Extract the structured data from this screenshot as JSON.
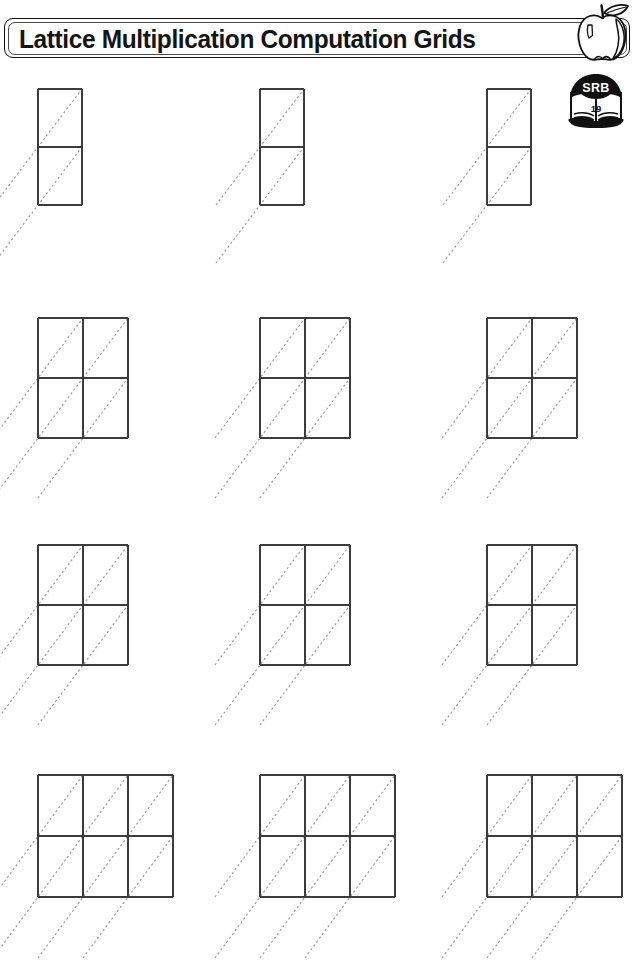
{
  "page": {
    "width": 641,
    "height": 938,
    "background": "#ffffff"
  },
  "header": {
    "title": "Lattice Multiplication Computation Grids",
    "banner_border_color": "#111111",
    "banner_fill": "#ffffff",
    "title_color": "#141414",
    "apple_icon": "apple-icon",
    "apple_outline_color": "#111111"
  },
  "reference_badge": {
    "icon": "student-reference-book-icon",
    "label": "SRB",
    "page_number": "19",
    "banner_color": "#111111",
    "book_color": "#111111"
  },
  "worksheet": {
    "grid_line_color": "#3c3c3c",
    "diagonal_color": "#9a9a9a",
    "diagonal_style": "dashed",
    "rows": [
      {
        "row_label": "row-1",
        "cols": 1,
        "cell_rows": 2,
        "cell_w": 44,
        "cell_h": 58,
        "y": 89,
        "x_positions": [
          38,
          260,
          487
        ]
      },
      {
        "row_label": "row-2",
        "cols": 2,
        "cell_rows": 2,
        "cell_w": 45,
        "cell_h": 60,
        "y": 318,
        "x_positions": [
          38,
          260,
          487
        ]
      },
      {
        "row_label": "row-3",
        "cols": 2,
        "cell_rows": 2,
        "cell_w": 45,
        "cell_h": 60,
        "y": 545,
        "x_positions": [
          38,
          260,
          487
        ]
      },
      {
        "row_label": "row-4",
        "cols": 3,
        "cell_rows": 2,
        "cell_w": 45,
        "cell_h": 61,
        "y": 775,
        "x_positions": [
          38,
          260,
          487
        ]
      }
    ]
  }
}
